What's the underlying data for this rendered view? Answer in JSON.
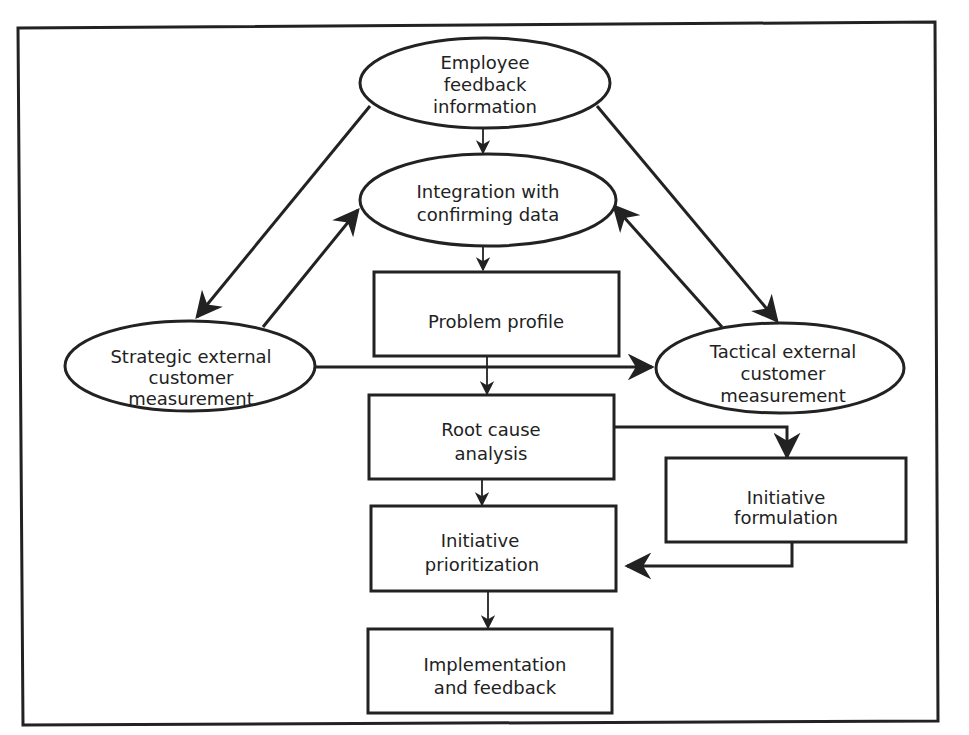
{
  "diagram": {
    "nodes": [
      {
        "id": "employee_feedback",
        "shape": "ellipse",
        "lines": [
          "Employee",
          "feedback",
          "information"
        ]
      },
      {
        "id": "integration",
        "shape": "ellipse",
        "lines": [
          "Integration with",
          "confirming data"
        ]
      },
      {
        "id": "problem_profile",
        "shape": "rect",
        "lines": [
          "Problem profile"
        ]
      },
      {
        "id": "strategic",
        "shape": "ellipse",
        "lines": [
          "Strategic external",
          "customer",
          "measurement"
        ]
      },
      {
        "id": "tactical",
        "shape": "ellipse",
        "lines": [
          "Tactical external",
          "customer",
          "measurement"
        ]
      },
      {
        "id": "root_cause",
        "shape": "rect",
        "lines": [
          "Root cause",
          "analysis"
        ]
      },
      {
        "id": "initiative_formulation",
        "shape": "rect",
        "lines": [
          "Initiative",
          "formulation"
        ]
      },
      {
        "id": "initiative_prioritization",
        "shape": "rect",
        "lines": [
          "Initiative",
          "prioritization"
        ]
      },
      {
        "id": "implementation",
        "shape": "rect",
        "lines": [
          "Implementation",
          "and feedback"
        ]
      }
    ],
    "edges": [
      {
        "from": "employee_feedback",
        "to": "integration"
      },
      {
        "from": "employee_feedback",
        "to": "strategic"
      },
      {
        "from": "employee_feedback",
        "to": "tactical"
      },
      {
        "from": "strategic",
        "to": "integration"
      },
      {
        "from": "tactical",
        "to": "integration"
      },
      {
        "from": "integration",
        "to": "problem_profile"
      },
      {
        "from": "strategic",
        "to": "tactical"
      },
      {
        "from": "problem_profile",
        "to": "root_cause"
      },
      {
        "from": "root_cause",
        "to": "initiative_formulation"
      },
      {
        "from": "root_cause",
        "to": "initiative_prioritization"
      },
      {
        "from": "initiative_formulation",
        "to": "initiative_prioritization"
      },
      {
        "from": "initiative_prioritization",
        "to": "implementation"
      }
    ]
  }
}
